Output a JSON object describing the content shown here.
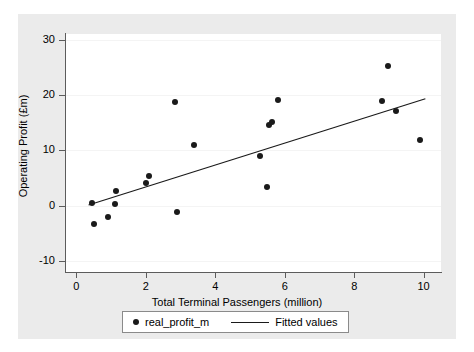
{
  "chart_data": {
    "type": "scatter",
    "title": "",
    "xlabel": "Total Terminal Passengers (million)",
    "ylabel": "Operating Profit (£m)",
    "xlim": [
      -0.3,
      10.5
    ],
    "ylim": [
      -12,
      31
    ],
    "xticks": [
      0,
      2,
      4,
      6,
      8,
      10
    ],
    "xtick_labels": [
      "0",
      "2",
      "4",
      "6",
      "8",
      "10"
    ],
    "yticks": [
      -10,
      0,
      10,
      20,
      30
    ],
    "ytick_labels": [
      "-10",
      "0",
      "10",
      "20",
      "30"
    ],
    "grid": "horizontal-faint",
    "legend_position": "below-plot-center",
    "series": [
      {
        "name": "real_profit_m",
        "type": "scatter",
        "marker": "filled-circle",
        "color": "#1a1a1a",
        "points": [
          {
            "x": 0.45,
            "y": 0.5
          },
          {
            "x": 0.5,
            "y": -3.3
          },
          {
            "x": 0.9,
            "y": -2.0
          },
          {
            "x": 1.1,
            "y": 0.3
          },
          {
            "x": 1.15,
            "y": 2.6
          },
          {
            "x": 2.0,
            "y": 4.0
          },
          {
            "x": 2.1,
            "y": 5.3
          },
          {
            "x": 2.85,
            "y": 18.7
          },
          {
            "x": 2.9,
            "y": -1.2
          },
          {
            "x": 3.4,
            "y": 11.0
          },
          {
            "x": 5.3,
            "y": 9.0
          },
          {
            "x": 5.5,
            "y": 3.3
          },
          {
            "x": 5.55,
            "y": 14.5
          },
          {
            "x": 5.62,
            "y": 15.1
          },
          {
            "x": 5.8,
            "y": 19.0
          },
          {
            "x": 8.8,
            "y": 18.9
          },
          {
            "x": 8.98,
            "y": 25.3
          },
          {
            "x": 9.2,
            "y": 17.1
          },
          {
            "x": 9.9,
            "y": 11.9
          }
        ]
      },
      {
        "name": "Fitted values",
        "type": "line",
        "color": "#1a1a1a",
        "endpoints": [
          {
            "x": 0.35,
            "y": 0.1
          },
          {
            "x": 10.05,
            "y": 19.3
          }
        ]
      }
    ]
  },
  "legend": {
    "entries": [
      {
        "label": "real_profit_m",
        "marker": "filled-circle"
      },
      {
        "label": "Fitted values",
        "marker": "line"
      }
    ]
  }
}
